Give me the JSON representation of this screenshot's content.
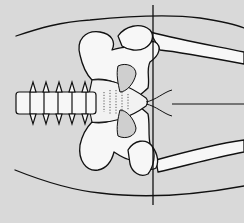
{
  "figure": {
    "type": "anatomical-illustration",
    "background_color": "#d9d9d9",
    "bone_fill": "#f7f7f7",
    "line_color": "#111111",
    "labels": []
  }
}
